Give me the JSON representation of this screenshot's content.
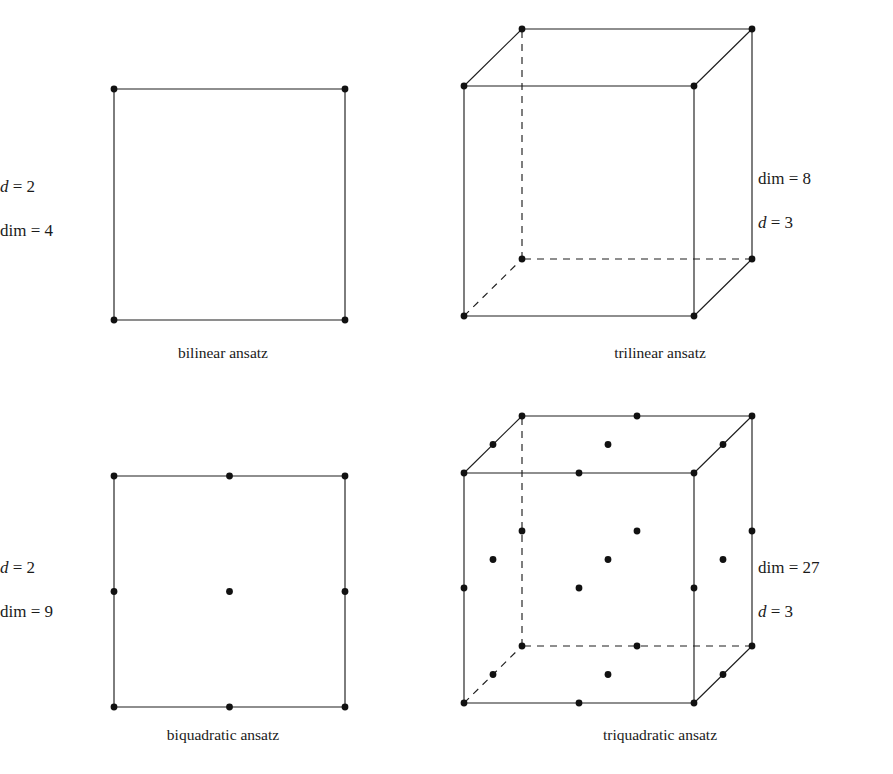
{
  "figure": {
    "background": "#ffffff",
    "ink": "#1f1f1f",
    "node_color": "#111111",
    "panels": [
      {
        "key": "bilinear",
        "caption": "bilinear ansatz",
        "shape": "square",
        "dimension_label": {
          "symbol": "d",
          "equals": "=",
          "value": "2"
        },
        "dim_label": {
          "symbol": "dim",
          "equals": "=",
          "value": "4"
        },
        "label_order": [
          "d",
          "dim"
        ],
        "label_side": "left",
        "nodes_per_edge": 2,
        "node_count": 4
      },
      {
        "key": "trilinear",
        "caption": "trilinear ansatz",
        "shape": "cube",
        "dimension_label": {
          "symbol": "d",
          "equals": "=",
          "value": "3"
        },
        "dim_label": {
          "symbol": "dim",
          "equals": "=",
          "value": "8"
        },
        "label_order": [
          "dim",
          "d"
        ],
        "label_side": "right",
        "nodes_per_edge": 2,
        "node_count": 8
      },
      {
        "key": "biquadratic",
        "caption": "biquadratic ansatz",
        "shape": "square",
        "dimension_label": {
          "symbol": "d",
          "equals": "=",
          "value": "2"
        },
        "dim_label": {
          "symbol": "dim",
          "equals": "=",
          "value": "9"
        },
        "label_order": [
          "d",
          "dim"
        ],
        "label_side": "left",
        "nodes_per_edge": 3,
        "node_count": 9
      },
      {
        "key": "triquadratic",
        "caption": "triquadratic ansatz",
        "shape": "cube",
        "dimension_label": {
          "symbol": "d",
          "equals": "=",
          "value": "3"
        },
        "dim_label": {
          "symbol": "dim",
          "equals": "=",
          "value": "27"
        },
        "label_order": [
          "dim",
          "d"
        ],
        "label_side": "right",
        "nodes_per_edge": 3,
        "node_count": 27
      }
    ]
  },
  "chart_data": {
    "type": "diagram",
    "title": "",
    "items": [
      {
        "name": "bilinear ansatz",
        "d": 2,
        "dim": 4,
        "nodes_per_edge": 2,
        "geometry": "square"
      },
      {
        "name": "trilinear ansatz",
        "d": 3,
        "dim": 8,
        "nodes_per_edge": 2,
        "geometry": "cube"
      },
      {
        "name": "biquadratic ansatz",
        "d": 2,
        "dim": 9,
        "nodes_per_edge": 3,
        "geometry": "square"
      },
      {
        "name": "triquadratic ansatz",
        "d": 3,
        "dim": 27,
        "nodes_per_edge": 3,
        "geometry": "cube"
      }
    ]
  },
  "geometry": {
    "square": {
      "x0": 114,
      "y0": 89,
      "size": 231
    },
    "cube": {
      "x0": 18,
      "y0": 86,
      "size": 230,
      "depth_x": 58,
      "depth_y": -57
    },
    "dot_radius": 3.4
  },
  "placement": {
    "bilinear": {
      "labels_x": 14,
      "labels_y": [
        178,
        222
      ],
      "caption_x": 0,
      "caption_y": 345,
      "caption_w": 446
    },
    "trilinear": {
      "labels_x": 312,
      "labels_y": [
        170,
        214
      ],
      "caption_x": 14,
      "caption_y": 345,
      "caption_w": 400
    },
    "biquadratic": {
      "labels_x": 14,
      "labels_y": [
        172,
        216
      ],
      "caption_x": 0,
      "caption_y": 340,
      "caption_w": 446
    },
    "triquadratic": {
      "labels_x": 312,
      "labels_y": [
        172,
        216
      ],
      "caption_x": 14,
      "caption_y": 340,
      "caption_w": 400
    }
  }
}
